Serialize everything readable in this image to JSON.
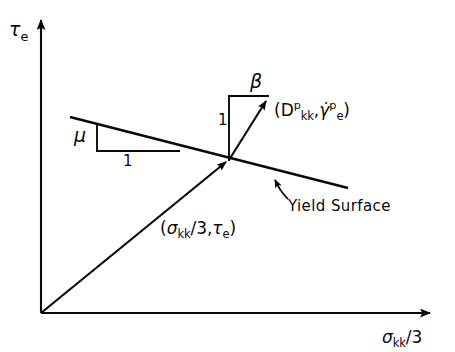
{
  "figure": {
    "name": "yield-surface-stress-space-diagram",
    "background_color": "#ffffff",
    "ink_color": "#0a0a0a",
    "width": 455,
    "height": 352
  },
  "axes": {
    "y_label": {
      "symbol": "τ",
      "subscript": "e",
      "full": "τ_e"
    },
    "x_label": {
      "symbol": "σ",
      "subscript": "kk",
      "suffix": "/3",
      "full": "σ_kk/3"
    },
    "origin": [
      41,
      313
    ],
    "x_axis_end": [
      440,
      313
    ],
    "y_axis_end": [
      41,
      12
    ],
    "arrowheads": "both"
  },
  "annotations": {
    "friction_slope": {
      "rise_label": "μ",
      "run_label": "1",
      "description": "friction-slope-triangle"
    },
    "dilatancy_slope": {
      "top_label": "β",
      "rise_label": "1",
      "description": "dilatancy-slope-triangle"
    },
    "plastic_flow_vector": {
      "open_paren": "(",
      "first_symbol": "D",
      "first_superscript": "p",
      "first_subscript": "kk",
      "comma": ",",
      "second_symbol": "γ̇",
      "second_superscript": "p",
      "second_subscript": "e",
      "close_paren": ")",
      "full": "(D^p_kk, γ̇^p_e)"
    },
    "stress_point": {
      "open_paren": "(",
      "first_symbol": "σ",
      "first_subscript": "kk",
      "first_suffix": "/3",
      "comma": ",",
      "second_symbol": "τ",
      "second_subscript": "e",
      "close_paren": ")",
      "full": "(σ_kk/3, τ_e)"
    },
    "yield_surface": {
      "label": "Yield Surface"
    }
  },
  "geometry": {
    "yield_surface_line": {
      "from": [
        70,
        117
      ],
      "to": [
        348,
        188
      ]
    },
    "radial_stress_line": {
      "from": [
        41,
        313
      ],
      "to": [
        229,
        160
      ]
    },
    "flow_vector": {
      "from": [
        229,
        160
      ],
      "to": [
        271,
        97
      ]
    },
    "intersection_point": [
      229,
      160
    ],
    "mu_triangle": {
      "apex": [
        97,
        125
      ],
      "corner": [
        97,
        151
      ],
      "run_end": [
        178,
        151
      ]
    },
    "beta_triangle": {
      "base": [
        229,
        160
      ],
      "top": [
        229,
        97
      ],
      "top_right": [
        268,
        97
      ]
    }
  }
}
